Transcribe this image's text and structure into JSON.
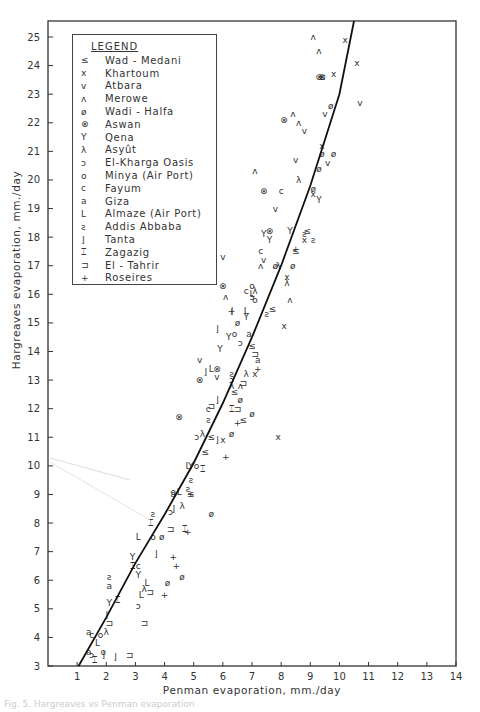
{
  "figure": {
    "caption": "Fig. 5. Hargreaves vs Penman evaporation"
  },
  "legend": {
    "title": "LEGEND",
    "items": [
      {
        "symbol": "≤",
        "label": "Wad - Medani"
      },
      {
        "symbol": "x",
        "label": "Khartoum"
      },
      {
        "symbol": "v",
        "label": "Atbara"
      },
      {
        "symbol": "ʌ",
        "label": "Merowe"
      },
      {
        "symbol": "ø",
        "label": "Wadi - Halfa"
      },
      {
        "symbol": "⊗",
        "label": "Aswan"
      },
      {
        "symbol": "Y",
        "label": "Qena"
      },
      {
        "symbol": "λ",
        "label": "Asyût"
      },
      {
        "symbol": "ɔ",
        "label": "El-Kharga Oasis"
      },
      {
        "symbol": "o",
        "label": "Minya (Air Port)"
      },
      {
        "symbol": "c",
        "label": "Fayum"
      },
      {
        "symbol": "a",
        "label": "Giza"
      },
      {
        "symbol": "L",
        "label": "Almaze (Air Port)"
      },
      {
        "symbol": "ƨ",
        "label": "Addis Abbaba"
      },
      {
        "symbol": "⌋",
        "label": "Tanta"
      },
      {
        "symbol": "⌶",
        "label": "Zagazig"
      },
      {
        "symbol": "⊐",
        "label": "El - Tahrir"
      },
      {
        "symbol": "+",
        "label": "Roseires"
      }
    ]
  },
  "chart_data": {
    "type": "scatter",
    "title": "",
    "xlabel": "Penman evaporation, mm./day",
    "ylabel": "Hargreaves evaporation, mm./day",
    "xlim": [
      0,
      14
    ],
    "ylim": [
      3,
      25.5
    ],
    "x_ticks": [
      1,
      2,
      3,
      4,
      5,
      6,
      7,
      8,
      9,
      10,
      11,
      12,
      13,
      14
    ],
    "y_ticks": [
      3,
      4,
      5,
      6,
      7,
      8,
      9,
      10,
      11,
      12,
      13,
      14,
      15,
      16,
      17,
      18,
      19,
      20,
      21,
      22,
      23,
      24,
      25
    ],
    "grid": false,
    "legend_position": "upper-left (inside)",
    "fit_curve": {
      "name": "fitted curve",
      "x": [
        1.05,
        2.0,
        3.0,
        4.0,
        5.0,
        6.0,
        7.0,
        8.0,
        9.0,
        10.0,
        10.5
      ],
      "y": [
        3.0,
        4.7,
        6.6,
        8.3,
        10.1,
        12.2,
        14.5,
        17.0,
        19.8,
        23.0,
        25.6
      ]
    },
    "series": [
      {
        "name": "Wad - Medani",
        "symbol": "≤",
        "points": [
          [
            8.9,
            18.2
          ],
          [
            8.5,
            17.5
          ],
          [
            7.7,
            15.5
          ],
          [
            6.4,
            12.6
          ],
          [
            6.7,
            11.6
          ],
          [
            7.0,
            14.2
          ],
          [
            5.4,
            10.5
          ],
          [
            5.6,
            11.0
          ],
          [
            4.9,
            9.0
          ],
          [
            9.4,
            23.6
          ]
        ]
      },
      {
        "name": "Khartoum",
        "symbol": "x",
        "points": [
          [
            10.2,
            24.9
          ],
          [
            10.6,
            24.1
          ],
          [
            9.8,
            23.7
          ],
          [
            9.4,
            21.2
          ],
          [
            9.1,
            19.5
          ],
          [
            8.2,
            16.6
          ],
          [
            8.8,
            17.9
          ],
          [
            8.1,
            14.9
          ],
          [
            7.1,
            13.2
          ],
          [
            7.9,
            11.0
          ],
          [
            6.0,
            10.9
          ]
        ]
      },
      {
        "name": "Atbara",
        "symbol": "v",
        "points": [
          [
            10.7,
            22.7
          ],
          [
            9.6,
            20.6
          ],
          [
            9.5,
            22.3
          ],
          [
            8.8,
            21.7
          ],
          [
            8.5,
            20.7
          ],
          [
            7.4,
            17.2
          ],
          [
            6.0,
            17.3
          ],
          [
            7.8,
            19.0
          ],
          [
            5.2,
            13.7
          ],
          [
            5.8,
            13.1
          ]
        ]
      },
      {
        "name": "Merowe",
        "symbol": "ʌ",
        "points": [
          [
            9.1,
            25.0
          ],
          [
            9.3,
            24.5
          ],
          [
            8.4,
            22.3
          ],
          [
            8.6,
            22.0
          ],
          [
            7.1,
            20.3
          ],
          [
            7.3,
            17.0
          ],
          [
            6.1,
            15.9
          ],
          [
            8.3,
            15.8
          ],
          [
            6.6,
            12.8
          ]
        ]
      },
      {
        "name": "Wadi - Halfa",
        "symbol": "ø",
        "points": [
          [
            9.7,
            22.6
          ],
          [
            9.8,
            20.9
          ],
          [
            9.4,
            20.9
          ],
          [
            9.3,
            20.4
          ],
          [
            9.1,
            19.7
          ],
          [
            8.4,
            17.0
          ],
          [
            7.8,
            17.0
          ],
          [
            6.5,
            15.0
          ],
          [
            6.6,
            12.3
          ],
          [
            7.0,
            11.8
          ],
          [
            6.3,
            11.1
          ],
          [
            4.6,
            6.1
          ],
          [
            3.9,
            7.5
          ],
          [
            4.1,
            5.9
          ],
          [
            5.6,
            8.3
          ]
        ]
      },
      {
        "name": "Aswan",
        "symbol": "⊗",
        "points": [
          [
            9.3,
            23.6
          ],
          [
            9.4,
            23.6
          ],
          [
            8.1,
            22.1
          ],
          [
            7.4,
            19.6
          ],
          [
            6.0,
            16.3
          ],
          [
            7.6,
            18.2
          ],
          [
            4.5,
            11.7
          ],
          [
            5.8,
            13.4
          ],
          [
            5.2,
            13.0
          ]
        ]
      },
      {
        "name": "Qena",
        "symbol": "Y",
        "points": [
          [
            9.3,
            19.3
          ],
          [
            8.3,
            18.2
          ],
          [
            7.6,
            17.9
          ],
          [
            7.4,
            18.1
          ],
          [
            6.8,
            15.2
          ],
          [
            6.2,
            14.5
          ],
          [
            5.9,
            14.1
          ],
          [
            4.9,
            10.0
          ],
          [
            2.9,
            6.8
          ],
          [
            3.1,
            6.2
          ],
          [
            2.1,
            5.2
          ]
        ]
      },
      {
        "name": "Asyût",
        "symbol": "λ",
        "points": [
          [
            8.6,
            20.0
          ],
          [
            7.9,
            17.0
          ],
          [
            8.2,
            16.4
          ],
          [
            7.1,
            16.1
          ],
          [
            6.8,
            13.2
          ],
          [
            6.3,
            12.8
          ],
          [
            5.3,
            11.1
          ],
          [
            4.6,
            8.6
          ],
          [
            3.3,
            5.7
          ],
          [
            2.0,
            4.2
          ]
        ]
      },
      {
        "name": "El-Kharga Oasis",
        "symbol": "ɔ",
        "points": [
          [
            7.0,
            15.9
          ],
          [
            6.6,
            14.3
          ],
          [
            6.3,
            13.0
          ],
          [
            5.1,
            11.0
          ],
          [
            4.2,
            8.4
          ],
          [
            3.1,
            5.1
          ],
          [
            1.5,
            3.4
          ]
        ]
      },
      {
        "name": "Minya (Air Port)",
        "symbol": "o",
        "points": [
          [
            7.1,
            15.8
          ],
          [
            7.0,
            16.3
          ],
          [
            6.4,
            14.6
          ],
          [
            4.3,
            9.1
          ],
          [
            3.6,
            7.5
          ],
          [
            1.9,
            3.5
          ],
          [
            1.8,
            4.1
          ],
          [
            5.1,
            10.0
          ]
        ]
      },
      {
        "name": "Fayum",
        "symbol": "c",
        "points": [
          [
            8.0,
            19.6
          ],
          [
            7.3,
            17.5
          ],
          [
            6.8,
            16.1
          ],
          [
            5.5,
            12.0
          ],
          [
            3.1,
            6.5
          ],
          [
            1.5,
            4.1
          ]
        ]
      },
      {
        "name": "Giza",
        "symbol": "a",
        "points": [
          [
            6.9,
            14.6
          ],
          [
            7.2,
            13.7
          ],
          [
            4.3,
            9.0
          ],
          [
            2.1,
            5.8
          ],
          [
            1.4,
            4.2
          ],
          [
            1.4,
            3.5
          ]
        ]
      },
      {
        "name": "Almaze (Air Port)",
        "symbol": "L",
        "points": [
          [
            7.0,
            16.0
          ],
          [
            6.8,
            15.4
          ],
          [
            5.6,
            13.4
          ],
          [
            4.8,
            10.0
          ],
          [
            4.5,
            9.1
          ],
          [
            3.4,
            5.9
          ],
          [
            3.2,
            5.5
          ],
          [
            3.1,
            7.5
          ],
          [
            1.7,
            3.8
          ]
        ]
      },
      {
        "name": "Addis Abbaba",
        "symbol": "ƨ",
        "points": [
          [
            8.8,
            18.1
          ],
          [
            9.1,
            17.9
          ],
          [
            7.5,
            15.3
          ],
          [
            6.3,
            13.2
          ],
          [
            5.5,
            11.6
          ],
          [
            4.9,
            9.5
          ],
          [
            4.8,
            9.2
          ],
          [
            3.6,
            8.3
          ],
          [
            2.1,
            6.1
          ]
        ]
      },
      {
        "name": "Tanta",
        "symbol": "⌋",
        "points": [
          [
            6.3,
            15.4
          ],
          [
            5.8,
            14.8
          ],
          [
            5.4,
            13.3
          ],
          [
            5.8,
            12.3
          ],
          [
            5.8,
            10.9
          ],
          [
            4.3,
            8.5
          ],
          [
            3.7,
            6.9
          ],
          [
            2.0,
            4.8
          ],
          [
            2.3,
            3.3
          ],
          [
            1.9,
            3.4
          ]
        ]
      },
      {
        "name": "Zagazig",
        "symbol": "⌶",
        "points": [
          [
            6.3,
            12.0
          ],
          [
            5.3,
            9.9
          ],
          [
            4.7,
            7.8
          ],
          [
            3.5,
            8.0
          ],
          [
            2.9,
            6.5
          ],
          [
            2.4,
            5.3
          ],
          [
            1.6,
            3.2
          ]
        ]
      },
      {
        "name": "El - Tahrir",
        "symbol": "⊐",
        "points": [
          [
            7.1,
            13.9
          ],
          [
            6.7,
            12.9
          ],
          [
            6.5,
            12.0
          ],
          [
            5.6,
            12.1
          ],
          [
            4.2,
            7.8
          ],
          [
            3.5,
            5.6
          ],
          [
            3.3,
            4.5
          ],
          [
            2.8,
            3.4
          ],
          [
            2.1,
            4.5
          ]
        ]
      },
      {
        "name": "Roseires",
        "symbol": "+",
        "points": [
          [
            8.5,
            17.6
          ],
          [
            6.3,
            15.4
          ],
          [
            7.2,
            13.4
          ],
          [
            6.5,
            11.5
          ],
          [
            6.1,
            10.3
          ],
          [
            4.9,
            9.0
          ],
          [
            4.8,
            7.7
          ],
          [
            4.3,
            6.8
          ],
          [
            4.4,
            6.5
          ],
          [
            4.0,
            5.5
          ]
        ]
      }
    ]
  }
}
